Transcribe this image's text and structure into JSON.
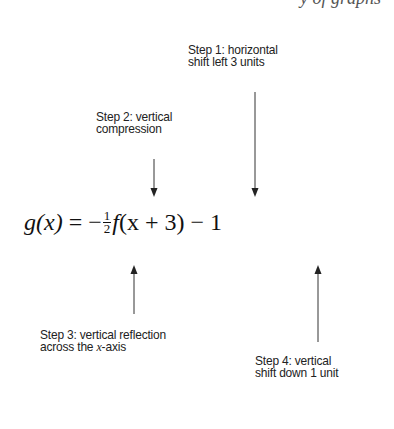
{
  "cutoff_header": {
    "text": "y of graphs"
  },
  "formula": {
    "lhs": "g(x)",
    "equals": "=",
    "sign": "−",
    "fraction": {
      "numerator": "1",
      "denominator": "2"
    },
    "function": "f",
    "argument": "(x + 3)",
    "constant_term": "− 1"
  },
  "annotations": [
    {
      "id": "step1",
      "lines": [
        "Step 1: horizontal",
        "shift left 3 units"
      ],
      "arrow": "down"
    },
    {
      "id": "step2",
      "lines": [
        "Step 2: vertical",
        "compression"
      ],
      "arrow": "down"
    },
    {
      "id": "step3",
      "lines": [
        "Step 3: vertical reflection",
        "across the x-axis"
      ],
      "arrow": "up"
    },
    {
      "id": "step4",
      "lines": [
        "Step 4: vertical",
        "shift down 1 unit"
      ],
      "arrow": "up"
    }
  ],
  "step3_line2_parts": {
    "before": "across the ",
    "var": "x",
    "after": "-axis"
  },
  "colors": {
    "text": "#222222",
    "arrow": "#222222",
    "background": "#ffffff"
  }
}
